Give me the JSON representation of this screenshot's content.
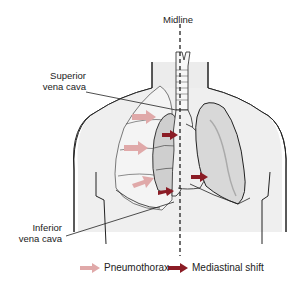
{
  "diagram": {
    "labels": {
      "midline": "Midline",
      "superior_vena_cava_line1": "Superior",
      "superior_vena_cava_line2": "vena cava",
      "inferior_vena_cava_line1": "Inferior",
      "inferior_vena_cava_line2": "vena cava"
    },
    "legend": [
      {
        "label": "Pneumothorax",
        "color": "#e0a9a9",
        "icon": "light-pink-arrow"
      },
      {
        "label": "Mediastinal shift",
        "color": "#8b1c25",
        "icon": "dark-red-arrow"
      }
    ],
    "colors": {
      "outline": "#222222",
      "body_fill": "#ececec",
      "lung_fill": "#d6d6d6",
      "lung_shade": "#bdbdbd",
      "pneumothorax_arrow": "#e0a9a9",
      "mediastinal_arrow": "#8b1c25"
    }
  }
}
